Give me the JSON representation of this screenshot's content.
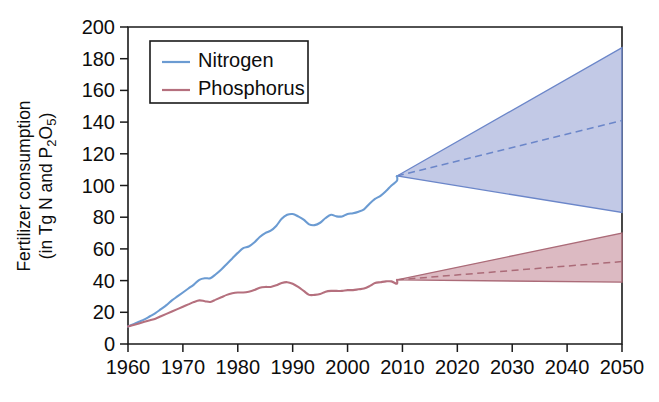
{
  "chart_data": {
    "type": "line",
    "title": "",
    "xlabel": "",
    "ylabel_line1": "Fertilizer consumption",
    "ylabel_line2": "(in Tg N and P2O5)",
    "xlim": [
      1960,
      2050
    ],
    "ylim": [
      0,
      200
    ],
    "grid": false,
    "legend_position": "top-left",
    "xticks": [
      1960,
      1970,
      1980,
      1990,
      2000,
      2010,
      2020,
      2030,
      2040,
      2050
    ],
    "yticks": [
      0,
      20,
      40,
      60,
      80,
      100,
      120,
      140,
      160,
      180,
      200
    ],
    "xtick_labels": [
      "1960",
      "1970",
      "1980",
      "1990",
      "2000",
      "2010",
      "2020",
      "2030",
      "2040",
      "2050"
    ],
    "ytick_labels": [
      "0",
      "20",
      "40",
      "60",
      "80",
      "100",
      "120",
      "140",
      "160",
      "180",
      "200"
    ],
    "legend": [
      {
        "name": "Nitrogen",
        "color": "#6b9bd2"
      },
      {
        "name": "Phosphorus",
        "color": "#b5707e"
      }
    ],
    "series": [
      {
        "name": "Nitrogen",
        "color": "#6b9bd2",
        "band_fill": "#aab4dd",
        "band_stroke": "#6b86c9",
        "historical_x": [
          1960,
          1961,
          1962,
          1963,
          1964,
          1965,
          1966,
          1967,
          1968,
          1969,
          1970,
          1971,
          1972,
          1973,
          1974,
          1975,
          1976,
          1977,
          1978,
          1979,
          1980,
          1981,
          1982,
          1983,
          1984,
          1985,
          1986,
          1987,
          1988,
          1989,
          1990,
          1991,
          1992,
          1993,
          1994,
          1995,
          1996,
          1997,
          1998,
          1999,
          2000,
          2001,
          2002,
          2003,
          2004,
          2005,
          2006,
          2007,
          2008,
          2009
        ],
        "historical_y": [
          11,
          12.5,
          14,
          15.5,
          17.5,
          19.5,
          22,
          24.5,
          27.5,
          30,
          32.5,
          35,
          37.5,
          40.5,
          41.5,
          41.5,
          44,
          47,
          50.5,
          54,
          57.5,
          60.5,
          61.5,
          64,
          67.5,
          70,
          71.5,
          74.5,
          79,
          81.5,
          82,
          80.5,
          78.5,
          75.5,
          75,
          76.5,
          79.5,
          81.5,
          80.5,
          80.5,
          82,
          82.5,
          83.5,
          85,
          88.5,
          91.5,
          93.5,
          96.5,
          100,
          103
        ],
        "projection_start_x": 2009,
        "projection_start_y": 106,
        "projection_x": [
          2009,
          2050
        ],
        "projection_upper": [
          106,
          187
        ],
        "projection_median": [
          106,
          141
        ],
        "projection_lower": [
          106,
          83
        ]
      },
      {
        "name": "Phosphorus",
        "color": "#b5707e",
        "band_fill": "#cfa0aa",
        "band_stroke": "#ab6b78",
        "historical_x": [
          1960,
          1961,
          1962,
          1963,
          1964,
          1965,
          1966,
          1967,
          1968,
          1969,
          1970,
          1971,
          1972,
          1973,
          1974,
          1975,
          1976,
          1977,
          1978,
          1979,
          1980,
          1981,
          1982,
          1983,
          1984,
          1985,
          1986,
          1987,
          1988,
          1989,
          1990,
          1991,
          1992,
          1993,
          1994,
          1995,
          1996,
          1997,
          1998,
          1999,
          2000,
          2001,
          2002,
          2003,
          2004,
          2005,
          2006,
          2007,
          2008,
          2009
        ],
        "historical_y": [
          11,
          12,
          13,
          14,
          15,
          16,
          17.5,
          19,
          20.5,
          22,
          23.5,
          25,
          26.5,
          27.5,
          27,
          26.5,
          28,
          29.5,
          31,
          32,
          32.5,
          32.5,
          33,
          34,
          35.5,
          36,
          36,
          37,
          38.5,
          39,
          38,
          36,
          33.5,
          31,
          31,
          31.5,
          33,
          33.5,
          33.5,
          33.5,
          34,
          34,
          34.5,
          35,
          36.5,
          38.5,
          39,
          39.5,
          39.5,
          38
        ],
        "projection_start_x": 2009,
        "projection_start_y": 40.5,
        "projection_x": [
          2009,
          2050
        ],
        "projection_upper": [
          40.5,
          70
        ],
        "projection_median": [
          40.5,
          52
        ],
        "projection_lower": [
          40.5,
          39
        ]
      }
    ]
  }
}
